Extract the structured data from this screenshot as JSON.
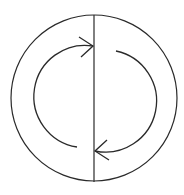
{
  "diagram": {
    "type": "circular-flow",
    "stroke_color": "#2a2a2a",
    "background": "#ffffff",
    "outer_circle": {
      "cx": 94,
      "cy": 98,
      "r": 83
    },
    "divider": {
      "x1": 94,
      "y1": 15,
      "x2": 94,
      "y2": 182
    },
    "arrows": [
      {
        "name": "left-arc-arrow",
        "direction": "up-right",
        "path": "M 77 147 A 51 51 0 0 1 93 46",
        "head": "M 79 37 L 93 46 L 81 57"
      },
      {
        "name": "right-arc-arrow",
        "direction": "down-left",
        "path": "M 116 51 A 51 51 0 0 1 95 151",
        "head": "M 107 140 L 95 151 L 109 160"
      }
    ]
  }
}
